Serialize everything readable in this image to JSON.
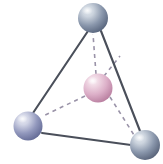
{
  "figure": {
    "name": "tetrahedral-molecular-geometry",
    "background_color": "#ffffff",
    "width": 163,
    "height": 164
  },
  "style": {
    "bond_solid_color": "#4a4f5a",
    "bond_solid_width": 2.1,
    "bond_dashed_color": "#9a93a8",
    "bond_dashed_width": 1.6,
    "dash_pattern": "4 4",
    "sphere_outline_color": "#5d6575"
  },
  "atoms": [
    {
      "id": "atom-top",
      "label": "top-vertex-atom",
      "role": "outer",
      "cx": 93,
      "cy": 18,
      "r": 15,
      "color_light": "#ccd4de",
      "color_mid": "#8a97ac",
      "color_dark": "#58657d",
      "highlight_color": "#dfe5ec"
    },
    {
      "id": "atom-bottom-left",
      "label": "bottom-left-vertex-atom",
      "role": "outer",
      "cx": 28,
      "cy": 126,
      "r": 14.5,
      "color_light": "#d2d5e6",
      "color_mid": "#9298bd",
      "color_dark": "#646b96",
      "highlight_color": "#e4e6f1"
    },
    {
      "id": "atom-bottom-right",
      "label": "bottom-right-vertex-atom",
      "role": "outer",
      "cx": 145,
      "cy": 145,
      "r": 15,
      "color_light": "#ccd4de",
      "color_mid": "#8a97ac",
      "color_dark": "#586379",
      "highlight_color": "#dfe5ec"
    },
    {
      "id": "atom-center",
      "label": "central-atom",
      "role": "center",
      "cx": 98,
      "cy": 88,
      "r": 14.5,
      "color_light": "#f0d8e4",
      "color_mid": "#dcafc8",
      "color_dark": "#b97fa0",
      "highlight_color": "#f8ecf3"
    }
  ],
  "bonds_solid": [
    {
      "id": "edge-top-to-bottom-left",
      "x1": 88,
      "y1": 31,
      "x2": 33,
      "y2": 113
    },
    {
      "id": "edge-top-to-bottom-right",
      "x1": 101,
      "y1": 31,
      "x2": 140,
      "y2": 131
    },
    {
      "id": "edge-bottom-left-to-bottom-right",
      "x1": 42,
      "y1": 133,
      "x2": 131,
      "y2": 145
    }
  ],
  "bonds_dashed": [
    {
      "id": "bond-center-to-top",
      "x1": 96,
      "y1": 74,
      "x2": 93,
      "y2": 34
    },
    {
      "id": "bond-center-to-bottom-left",
      "x1": 85,
      "y1": 96,
      "x2": 43,
      "y2": 116
    },
    {
      "id": "bond-center-to-bottom-right",
      "x1": 110,
      "y1": 97,
      "x2": 134,
      "y2": 135
    },
    {
      "id": "bond-center-to-back",
      "x1": 104,
      "y1": 76,
      "x2": 120,
      "y2": 56
    }
  ]
}
